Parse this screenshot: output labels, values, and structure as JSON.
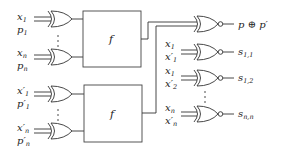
{
  "diagram": {
    "type": "logic-circuit",
    "top_block": {
      "function_label": "f",
      "inputs": [
        {
          "a": "x",
          "a_sub": "1",
          "b": "p",
          "b_sub": "1"
        },
        {
          "a": "x",
          "a_sub": "n",
          "b": "p",
          "b_sub": "n"
        }
      ]
    },
    "bottom_block": {
      "function_label": "f",
      "inputs": [
        {
          "a": "x′",
          "a_sub": "1",
          "b": "p′",
          "b_sub": "1"
        },
        {
          "a": "x′",
          "a_sub": "n",
          "b": "p′",
          "b_sub": "n"
        }
      ]
    },
    "outputs": [
      {
        "label": "p ⊕ p′",
        "inputs": [
          "f(top)",
          "f(bottom)"
        ]
      },
      {
        "label": "s",
        "label_sub": "1,1",
        "a": "x",
        "a_sub": "1",
        "b": "x′",
        "b_sub": "1"
      },
      {
        "label": "s",
        "label_sub": "1,2",
        "a": "x",
        "a_sub": "1",
        "b": "x′",
        "b_sub": "2"
      },
      {
        "label": "s",
        "label_sub": "n,n",
        "a": "x",
        "a_sub": "n",
        "b": "x′",
        "b_sub": "n"
      }
    ],
    "gate_type_left": "XOR",
    "gate_type_right": "XNOR",
    "ellipsis": "⋮"
  }
}
